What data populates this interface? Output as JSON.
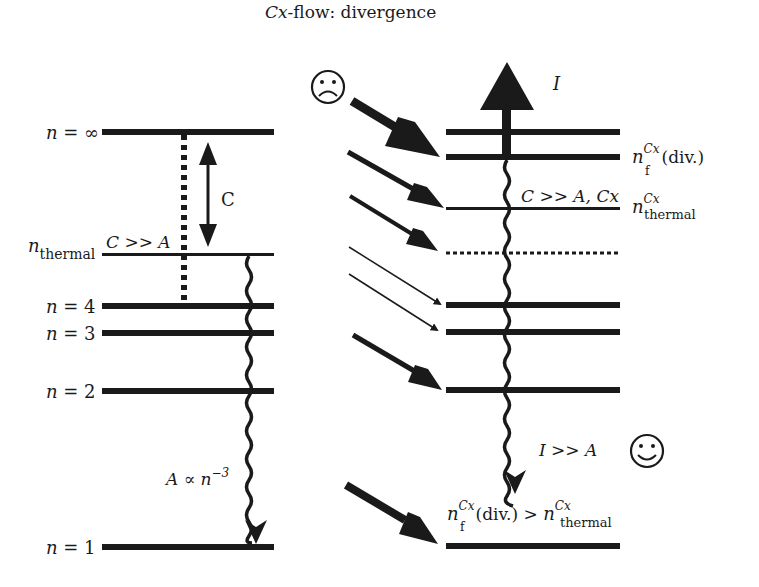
{
  "title": {
    "prefix_italic": "Cx",
    "rest": "-flow: divergence"
  },
  "left_panel": {
    "levels": [
      {
        "id": "n-inf",
        "label_n": "n",
        "label_rest": " = ∞",
        "y": 132,
        "thickness": 6
      },
      {
        "id": "n-thermal",
        "label_n": "n",
        "label_sub": "thermal",
        "y": 254,
        "thickness": 3
      },
      {
        "id": "n-4",
        "label_n": "n",
        "label_rest": " = 4",
        "y": 306,
        "thickness": 6
      },
      {
        "id": "n-3",
        "label_n": "n",
        "label_rest": " = 3",
        "y": 333,
        "thickness": 6
      },
      {
        "id": "n-2",
        "label_n": "n",
        "label_rest": " = 2",
        "y": 391,
        "thickness": 6
      },
      {
        "id": "n-1",
        "label_n": "n",
        "label_rest": " = 1",
        "y": 547,
        "thickness": 6
      }
    ],
    "collision_label": "C",
    "c_gg_a": "C >> A",
    "radiative_label": {
      "base": "A ∝ n",
      "exp": "−3"
    }
  },
  "right_panel": {
    "levels": [
      {
        "id": "r-top",
        "y": 132,
        "thickness": 6
      },
      {
        "id": "r-nf-div",
        "y": 157,
        "thickness": 6
      },
      {
        "id": "r-thermal-cx",
        "y": 208,
        "thickness": 3
      },
      {
        "id": "r-dotted",
        "y": 253,
        "thickness": 3,
        "dotted": true
      },
      {
        "id": "r-4",
        "y": 305,
        "thickness": 6
      },
      {
        "id": "r-3",
        "y": 332,
        "thickness": 6
      },
      {
        "id": "r-2",
        "y": 390,
        "thickness": 6
      },
      {
        "id": "r-1",
        "y": 546,
        "thickness": 6
      }
    ],
    "ionization_label": "I",
    "nf_div_label": {
      "n": "n",
      "sup": "Cx",
      "sub": "f",
      "rest": "(div.)"
    },
    "thermal_cx_label": {
      "n": "n",
      "sup": "Cx",
      "sub": "thermal"
    },
    "c_gg_a_cx": "C >> A, Cx",
    "i_gg_a": "I >> A",
    "bottom_relation": {
      "n": "n",
      "sup": "Cx",
      "sub": "f",
      "mid": "(div.) > ",
      "n2": "n",
      "sup2": "Cx",
      "sub2": "thermal"
    }
  },
  "icons": {
    "sad_face": "sad-face-icon",
    "happy_face": "happy-face-icon"
  },
  "colors": {
    "ink": "#1a1a1a",
    "background": "#ffffff"
  }
}
